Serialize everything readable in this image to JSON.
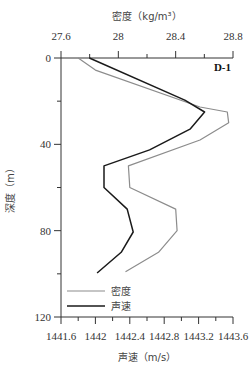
{
  "chart_data": {
    "type": "line",
    "title": "",
    "panel_label": "D-1",
    "top_axis": {
      "label": "密度（kg/m³）",
      "ticks": [
        "27.6",
        "28",
        "28.4",
        "28.8"
      ],
      "range": [
        27.6,
        28.8
      ]
    },
    "bottom_axis": {
      "label": "声速（m/s）",
      "ticks": [
        "1441.6",
        "1442",
        "1442.4",
        "1442.8",
        "1443.2",
        "1443.6"
      ],
      "range": [
        1441.6,
        1443.6
      ]
    },
    "y_axis": {
      "label": "深度（m）",
      "ticks": [
        "0",
        "40",
        "80",
        "120"
      ],
      "range": [
        0,
        120
      ],
      "inverted": true
    },
    "legend": [
      {
        "name": "密度",
        "color": "#8c8c8c"
      },
      {
        "name": "声速",
        "color": "#1a1a1a"
      }
    ],
    "legend_position": "lower-left",
    "grid": false,
    "series": [
      {
        "name": "密度",
        "axis": "top",
        "color": "#8c8c8c",
        "points": [
          [
            27.72,
            0
          ],
          [
            27.84,
            5.6
          ],
          [
            28.57,
            22.7
          ],
          [
            28.76,
            25
          ],
          [
            28.77,
            30
          ],
          [
            28.57,
            38
          ],
          [
            28.07,
            50
          ],
          [
            28.08,
            60
          ],
          [
            28.4,
            70
          ],
          [
            28.41,
            80
          ],
          [
            28.28,
            90
          ],
          [
            28.05,
            99
          ]
        ]
      },
      {
        "name": "声速",
        "axis": "bottom",
        "color": "#1a1a1a",
        "points": [
          [
            1441.93,
            0
          ],
          [
            1443.04,
            19.5
          ],
          [
            1443.27,
            25
          ],
          [
            1443.1,
            33
          ],
          [
            1442.63,
            42.6
          ],
          [
            1442.1,
            50
          ],
          [
            1442.1,
            60
          ],
          [
            1442.37,
            70
          ],
          [
            1442.44,
            80.6
          ],
          [
            1442.3,
            90
          ],
          [
            1442.02,
            99.6
          ]
        ]
      }
    ]
  }
}
